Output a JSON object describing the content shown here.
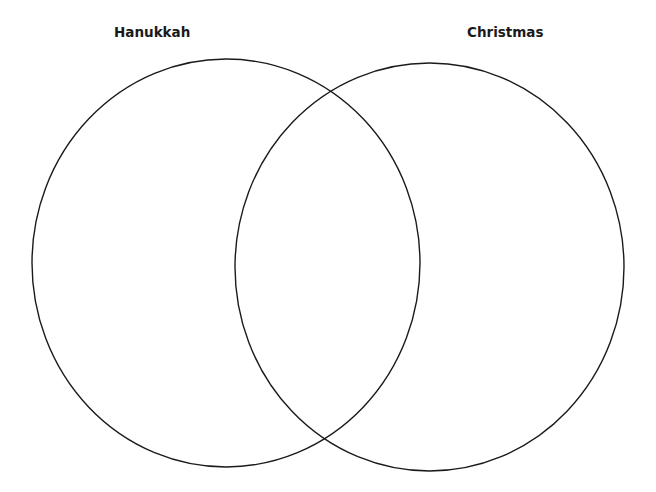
{
  "diagram": {
    "type": "venn",
    "sets": [
      {
        "label": "Hanukkah",
        "ellipse": {
          "cx": 226,
          "cy": 263,
          "rx": 194,
          "ry": 204
        }
      },
      {
        "label": "Christmas",
        "ellipse": {
          "cx": 429.5,
          "cy": 267,
          "rx": 194.5,
          "ry": 204
        }
      }
    ],
    "stroke_color": "#1a1a1a",
    "background": "#ffffff"
  }
}
